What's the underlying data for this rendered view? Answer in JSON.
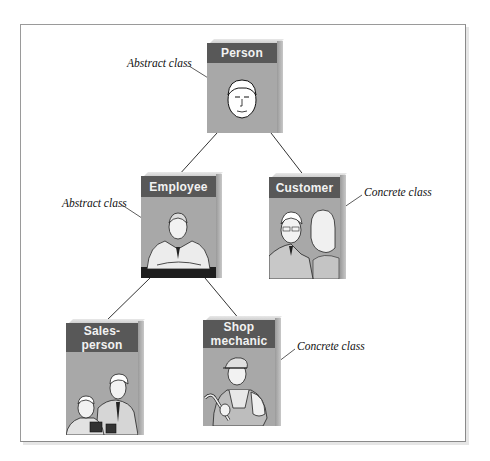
{
  "diagram": {
    "title": "",
    "colors": {
      "header": "#585858",
      "body": "#a8a8a8",
      "header_text": "#f2f2f2",
      "line": "#333333"
    },
    "classes": [
      {
        "id": "person",
        "label": "Person",
        "kind": "Abstract class",
        "illustration": "face-of-man"
      },
      {
        "id": "employee",
        "label": "Employee",
        "kind": "Abstract class",
        "illustration": "man-in-suit-with-tie"
      },
      {
        "id": "customer",
        "label": "Customer",
        "kind": "Concrete class",
        "illustration": "older-man-and-woman"
      },
      {
        "id": "salesperson",
        "label": "Sales-person",
        "label_line1": "Sales-",
        "label_line2": "person",
        "kind": "",
        "illustration": "two-men-reading"
      },
      {
        "id": "shop_mechanic",
        "label": "Shop mechanic",
        "label_line1": "Shop",
        "label_line2": "mechanic",
        "kind": "Concrete class",
        "illustration": "mechanic-with-wrench"
      }
    ],
    "edges": [
      {
        "from": "Person",
        "to": "Employee"
      },
      {
        "from": "Person",
        "to": "Customer"
      },
      {
        "from": "Employee",
        "to": "Sales-person"
      },
      {
        "from": "Employee",
        "to": "Shop mechanic"
      }
    ],
    "annotations": [
      {
        "text": "Abstract class",
        "target": "Person"
      },
      {
        "text": "Abstract class",
        "target": "Employee"
      },
      {
        "text": "Concrete class",
        "target": "Customer"
      },
      {
        "text": "Concrete class",
        "target": "Shop mechanic"
      }
    ]
  }
}
